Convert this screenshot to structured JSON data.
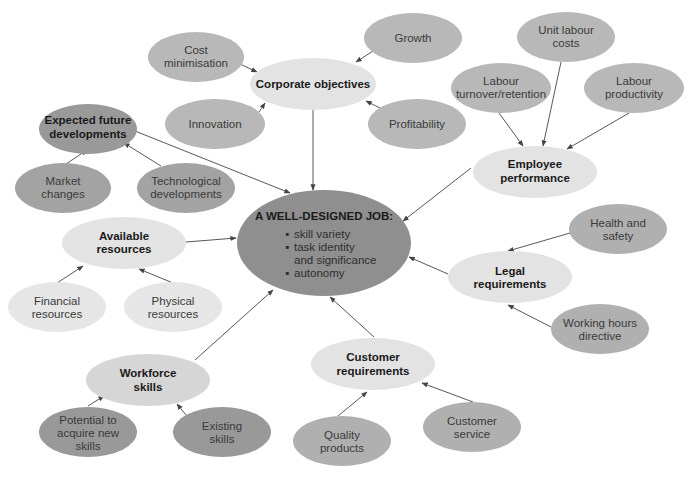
{
  "diagram": {
    "colors": {
      "central": "#8f8f8f",
      "hub": "#e3e3e3",
      "leaf": "#b8b8b8",
      "leaf_dark": "#9a9a9a",
      "leaf_light": "#e6e6e6",
      "arrow": "#444444",
      "background": "#ffffff"
    },
    "central": {
      "title": "A WELL-DESIGNED JOB:",
      "bullets": [
        "skill variety",
        "task identity",
        "and significance",
        "autonomy"
      ]
    },
    "hubs": {
      "corporate_objectives": {
        "lines": [
          "Corporate objectives"
        ]
      },
      "expected_future_developments": {
        "lines": [
          "Expected future",
          "developments"
        ]
      },
      "employee_performance": {
        "lines": [
          "Employee",
          "performance"
        ]
      },
      "available_resources": {
        "lines": [
          "Available",
          "resources"
        ]
      },
      "legal_requirements": {
        "lines": [
          "Legal",
          "requirements"
        ]
      },
      "customer_requirements": {
        "lines": [
          "Customer",
          "requirements"
        ]
      },
      "workforce_skills": {
        "lines": [
          "Workforce",
          "skills"
        ]
      }
    },
    "leaves": {
      "cost_minimisation": {
        "lines": [
          "Cost",
          "minimisation"
        ]
      },
      "growth": {
        "lines": [
          "Growth"
        ]
      },
      "innovation": {
        "lines": [
          "Innovation"
        ]
      },
      "profitability": {
        "lines": [
          "Profitability"
        ]
      },
      "market_changes": {
        "lines": [
          "Market",
          "changes"
        ]
      },
      "technological_developments": {
        "lines": [
          "Technological",
          "developments"
        ]
      },
      "unit_labour_costs": {
        "lines": [
          "Unit labour",
          "costs"
        ]
      },
      "labour_turnover": {
        "lines": [
          "Labour",
          "turnover/retention"
        ]
      },
      "labour_productivity": {
        "lines": [
          "Labour",
          "productivity"
        ]
      },
      "financial_resources": {
        "lines": [
          "Financial",
          "resources"
        ]
      },
      "physical_resources": {
        "lines": [
          "Physical",
          "resources"
        ]
      },
      "health_and_safety": {
        "lines": [
          "Health and",
          "safety"
        ]
      },
      "working_hours_directive": {
        "lines": [
          "Working hours",
          "directive"
        ]
      },
      "customer_service": {
        "lines": [
          "Customer",
          "service"
        ]
      },
      "quality_products": {
        "lines": [
          "Quality",
          "products"
        ]
      },
      "potential_new_skills": {
        "lines": [
          "Potential to",
          "acquire new",
          "skills"
        ]
      },
      "existing_skills": {
        "lines": [
          "Existing",
          "skills"
        ]
      }
    }
  }
}
